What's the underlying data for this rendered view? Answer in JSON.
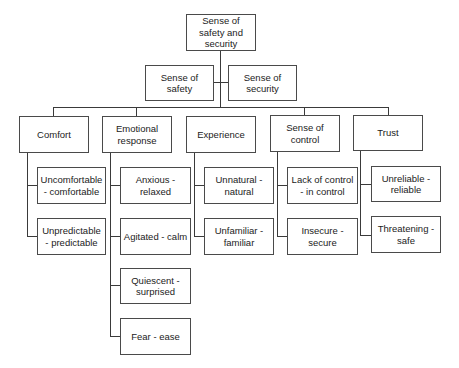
{
  "root": {
    "label": "Sense of safety and security"
  },
  "level2": [
    {
      "label": "Sense of safety"
    },
    {
      "label": "Sense of security"
    }
  ],
  "categories": [
    {
      "label": "Comfort",
      "items": [
        {
          "label": "Uncomfortable - comfortable"
        },
        {
          "label": "Unpredictable - predictable"
        }
      ]
    },
    {
      "label": "Emotional response",
      "items": [
        {
          "label": "Anxious - relaxed"
        },
        {
          "label": "Agitated - calm"
        },
        {
          "label": "Quiescent - surprised"
        },
        {
          "label": "Fear - ease"
        }
      ]
    },
    {
      "label": "Experience",
      "items": [
        {
          "label": "Unnatural - natural"
        },
        {
          "label": "Unfamiliar - familiar"
        }
      ]
    },
    {
      "label": "Sense of control",
      "items": [
        {
          "label": "Lack of control - in control"
        },
        {
          "label": "Insecure - secure"
        }
      ]
    },
    {
      "label": "Trust",
      "items": [
        {
          "label": "Unreliable - reliable"
        },
        {
          "label": "Threatening - safe"
        }
      ]
    }
  ],
  "colors": {
    "line": "#3a3a3a",
    "border": "#4a4a4a",
    "background": "#ffffff"
  }
}
